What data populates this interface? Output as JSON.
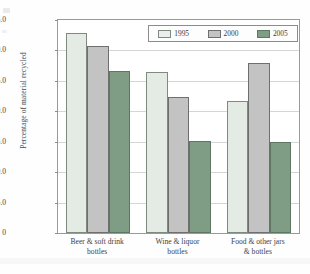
{
  "chart_data": {
    "type": "bar",
    "title": "",
    "xlabel": "",
    "ylabel": "Percentage of material recycled",
    "ylim": [
      0,
      35
    ],
    "yticks": [
      "0",
      "5.0",
      "10.0",
      "15.0",
      "20.0",
      "25.0",
      "30.0",
      "35.0"
    ],
    "ytick_values": [
      0,
      5,
      10,
      15,
      20,
      25,
      30,
      35
    ],
    "grid": true,
    "legend_position": "top-right",
    "categories": [
      "Beer & soft drink bottles",
      "Wine & liquor bottles",
      "Food & other jars & bottles"
    ],
    "category_lines": [
      [
        "Beer & soft drink",
        "bottles"
      ],
      [
        "Wine & liquor",
        "bottles"
      ],
      [
        "Food & other jars",
        "& bottles"
      ]
    ],
    "series": [
      {
        "name": "1995",
        "color": "#e3ebe4",
        "values": [
          32.8,
          26.4,
          21.7
        ]
      },
      {
        "name": "2000",
        "color": "#c3c3c3",
        "values": [
          30.7,
          22.3,
          28.0
        ]
      },
      {
        "name": "2005",
        "color": "#7f9c84",
        "values": [
          26.7,
          15.2,
          14.9
        ]
      }
    ]
  },
  "legend": {
    "items": [
      {
        "label": "1995"
      },
      {
        "label": "2000"
      },
      {
        "label": "2005"
      }
    ]
  }
}
